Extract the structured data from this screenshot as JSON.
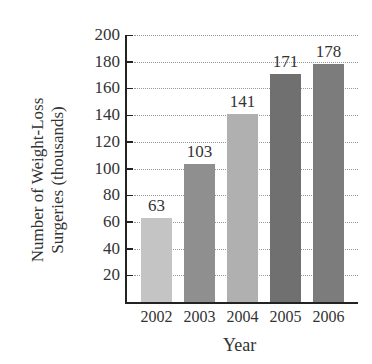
{
  "chart_data": {
    "type": "bar",
    "title": "",
    "xlabel": "Year",
    "ylabel": "Number of Weight-Loss Surgeries (thousands)",
    "ylabel_lines": [
      "Number of Weight-Loss",
      "Surgeries (thousands)"
    ],
    "categories": [
      "2002",
      "2003",
      "2004",
      "2005",
      "2006"
    ],
    "values": [
      63,
      103,
      141,
      171,
      178
    ],
    "value_labels": [
      "63",
      "103",
      "141",
      "171",
      "178"
    ],
    "bar_colors": [
      "#c4c4c4",
      "#8f8f8f",
      "#b0b0b0",
      "#707070",
      "#7c7c7c"
    ],
    "yticks": [
      20,
      40,
      60,
      80,
      100,
      120,
      140,
      160,
      180,
      200
    ],
    "ytick_labels": [
      "20",
      "40",
      "60",
      "80",
      "100",
      "120",
      "140",
      "160",
      "180",
      "200"
    ],
    "ylim": [
      0,
      200
    ],
    "grid": true,
    "legend": null
  }
}
